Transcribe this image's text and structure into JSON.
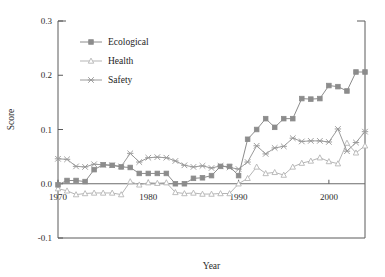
{
  "chart_data": {
    "type": "line",
    "title": "",
    "xlabel": "Year",
    "ylabel": "Score",
    "xlim": [
      1970,
      2004
    ],
    "ylim": [
      -0.1,
      0.3
    ],
    "xticks": [
      1970,
      1980,
      1990,
      2000
    ],
    "yticks": [
      -0.1,
      0.0,
      0.1,
      0.2,
      0.3
    ],
    "xtick_labels": [
      "1970",
      "1980",
      "1990",
      "2000"
    ],
    "ytick_labels": [
      "-0.1",
      "0.0",
      "0.1",
      "0.2",
      "0.3"
    ],
    "grid": false,
    "legend_position": "top-left",
    "zero_line": 0.0,
    "x": [
      1970,
      1971,
      1972,
      1973,
      1974,
      1975,
      1976,
      1977,
      1978,
      1979,
      1980,
      1981,
      1982,
      1983,
      1984,
      1985,
      1986,
      1987,
      1988,
      1989,
      1990,
      1991,
      1992,
      1993,
      1994,
      1995,
      1996,
      1997,
      1998,
      1999,
      2000,
      2001,
      2002,
      2003,
      2004
    ],
    "series": [
      {
        "name": "Ecological",
        "marker": "filled-square",
        "color": "#8c8c8c",
        "values": [
          -0.002,
          0.006,
          0.006,
          0.004,
          0.026,
          0.035,
          0.034,
          0.031,
          0.03,
          0.019,
          0.019,
          0.019,
          0.019,
          0.0,
          0.0,
          0.01,
          0.011,
          0.015,
          0.032,
          0.032,
          0.015,
          0.082,
          0.1,
          0.12,
          0.104,
          0.12,
          0.12,
          0.157,
          0.156,
          0.157,
          0.181,
          0.179,
          0.171,
          0.206,
          0.206
        ]
      },
      {
        "name": "Health",
        "marker": "open-triangle",
        "color": "#b5b5b5",
        "values": [
          -0.009,
          -0.013,
          -0.02,
          -0.018,
          -0.017,
          -0.017,
          -0.017,
          -0.02,
          0.004,
          -0.002,
          0.002,
          0.001,
          0.002,
          -0.016,
          -0.018,
          -0.017,
          -0.019,
          -0.019,
          -0.018,
          -0.018,
          0.0,
          0.01,
          0.031,
          0.019,
          0.021,
          0.016,
          0.031,
          0.038,
          0.042,
          0.048,
          0.041,
          0.037,
          0.075,
          0.057,
          0.07
        ]
      },
      {
        "name": "Safety",
        "marker": "x-cross",
        "color": "#9a9a9a",
        "values": [
          0.046,
          0.045,
          0.032,
          0.031,
          0.036,
          0.035,
          0.034,
          0.032,
          0.056,
          0.04,
          0.048,
          0.049,
          0.048,
          0.042,
          0.034,
          0.031,
          0.033,
          0.029,
          0.033,
          0.03,
          0.027,
          0.04,
          0.07,
          0.055,
          0.066,
          0.069,
          0.084,
          0.078,
          0.079,
          0.079,
          0.077,
          0.101,
          0.06,
          0.076,
          0.096
        ]
      }
    ]
  },
  "legend": {
    "items": [
      {
        "label": "Ecological"
      },
      {
        "label": "Health"
      },
      {
        "label": "Safety"
      }
    ]
  },
  "axes": {
    "x_title": "Year",
    "y_title": "Score"
  }
}
